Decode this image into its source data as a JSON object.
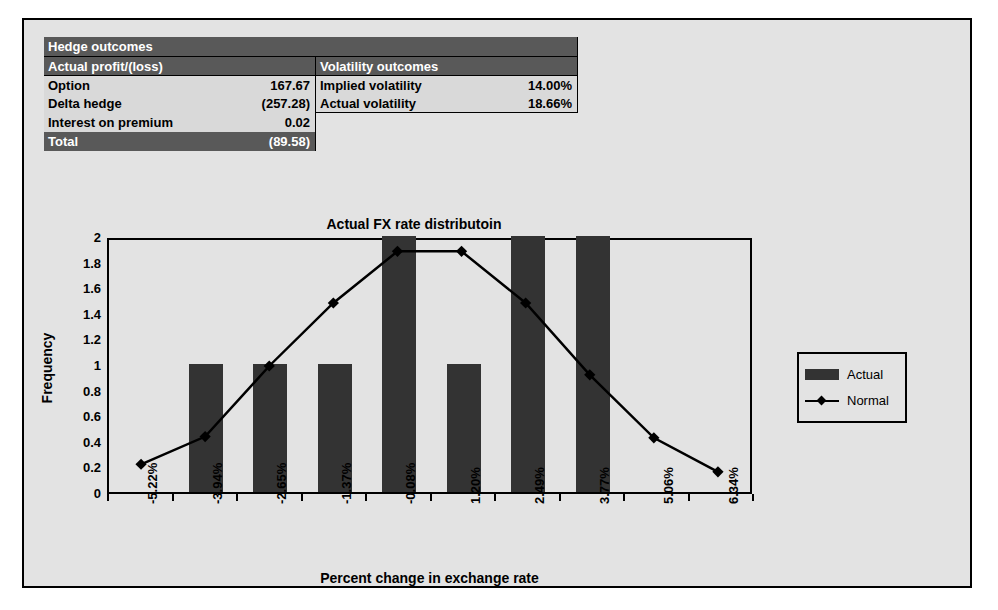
{
  "tables": {
    "main_header": "Hedge outcomes",
    "left": {
      "header": "Actual profit/(loss)",
      "rows": [
        {
          "label": "Option",
          "value": "167.67"
        },
        {
          "label": "Delta hedge",
          "value": "(257.28)"
        },
        {
          "label": "Interest on premium",
          "value": "0.02"
        }
      ],
      "total_label": "Total",
      "total_value": "(89.58)"
    },
    "right": {
      "header": "Volatility outcomes",
      "rows": [
        {
          "label": "Implied volatility",
          "value": "14.00%"
        },
        {
          "label": "Actual volatility",
          "value": "18.66%"
        }
      ]
    }
  },
  "chart_data": {
    "type": "bar",
    "title": "Actual FX rate distributoin",
    "xlabel": "Percent change in exchange rate",
    "ylabel": "Frequency",
    "categories": [
      "-5.22%",
      "-3.94%",
      "-2.65%",
      "-1.37%",
      "-0.08%",
      "1.20%",
      "2.49%",
      "3.77%",
      "5.06%",
      "6.34%"
    ],
    "ylim": [
      0,
      2
    ],
    "yticks": [
      "0",
      "0.2",
      "0.4",
      "0.6",
      "0.8",
      "1",
      "1.2",
      "1.4",
      "1.6",
      "1.8",
      "2"
    ],
    "grid": false,
    "legend_position": "right",
    "series": [
      {
        "name": "Actual",
        "type": "bar",
        "color": "#333333",
        "values": [
          0,
          1,
          1,
          1,
          2,
          1,
          2,
          2,
          0,
          0
        ]
      },
      {
        "name": "Normal",
        "type": "line",
        "color": "#000000",
        "marker": "diamond",
        "values": [
          0.22,
          0.44,
          1.0,
          1.5,
          1.91,
          1.91,
          1.5,
          0.93,
          0.43,
          0.16
        ]
      }
    ]
  },
  "legend": {
    "items": [
      {
        "label": "Actual",
        "marker": "bar-swatch"
      },
      {
        "label": "Normal",
        "marker": "line-diamond-swatch"
      }
    ]
  }
}
